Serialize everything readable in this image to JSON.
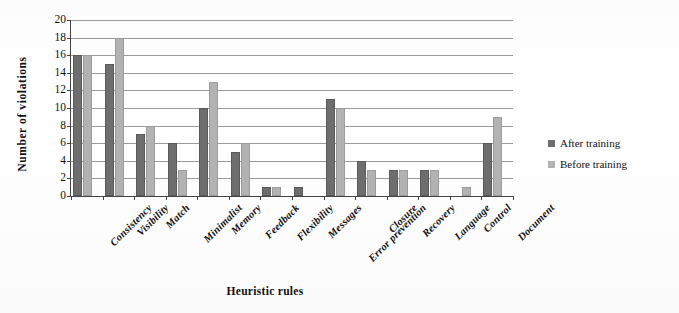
{
  "chart_data": {
    "type": "bar",
    "title": "",
    "xlabel": "Heuristic rules",
    "ylabel": "Number  of  violations",
    "ylim": [
      0,
      20
    ],
    "ytick_step": 2,
    "yticks": [
      "0",
      "2",
      "4",
      "6",
      "8",
      "10",
      "12",
      "14",
      "16",
      "18",
      "20"
    ],
    "grid": true,
    "legend_position": "right",
    "categories": [
      "Consistency",
      "Visibility",
      "Match",
      "Minimalist",
      "Memory",
      "Feedback",
      "Flexibility",
      "Messages",
      "Error prevention",
      "Closure",
      "Recovery",
      "Language",
      "Control",
      "Document"
    ],
    "series": [
      {
        "name": "After training",
        "color": "#6e6e6e",
        "values": [
          16,
          15,
          7,
          6,
          10,
          5,
          1,
          1,
          11,
          4,
          3,
          3,
          0,
          6
        ]
      },
      {
        "name": "Before training",
        "color": "#b3b3b3",
        "values": [
          16,
          18,
          8,
          3,
          13,
          6,
          1,
          0,
          10,
          3,
          3,
          3,
          1,
          9
        ]
      }
    ]
  },
  "legend": {
    "entries": [
      {
        "label": "After training",
        "color": "#6e6e6e"
      },
      {
        "label": "Before training",
        "color": "#b3b3b3"
      }
    ]
  }
}
